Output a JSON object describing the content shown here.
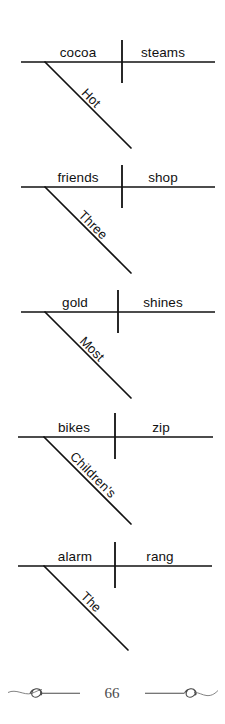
{
  "page": {
    "number": "66",
    "ornament_left": "flourish-ornament",
    "ornament_right": "flourish-ornament"
  },
  "diagrams": [
    {
      "index": 1,
      "subject": "cocoa",
      "verb": "steams",
      "modifier": "Hot",
      "sentence": "Hot cocoa steams"
    },
    {
      "index": 2,
      "subject": "friends",
      "verb": "shop",
      "modifier": "Three",
      "sentence": "Three friends shop"
    },
    {
      "index": 3,
      "subject": "gold",
      "verb": "shines",
      "modifier": "Most",
      "sentence": "Most gold shines"
    },
    {
      "index": 4,
      "subject": "bikes",
      "verb": "zip",
      "modifier": "Children's",
      "sentence": "Children's bikes zip"
    },
    {
      "index": 5,
      "subject": "alarm",
      "verb": "rang",
      "modifier": "The",
      "sentence": "The alarm rang"
    }
  ],
  "colors": {
    "ink": "#111111",
    "paper": "#ffffff",
    "footer_ink": "#4a4a4a"
  }
}
